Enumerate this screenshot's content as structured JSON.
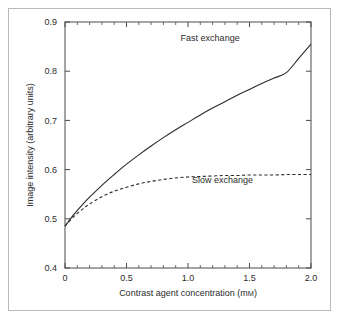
{
  "figure": {
    "background_color": "#ffffff",
    "frame_color": "#b9b9b9",
    "axis_color": "#4a4a4a",
    "curve_color": "#2a2a2a"
  },
  "chart_data": {
    "type": "line",
    "title": "",
    "xlabel": "Contrast agent concentration (mM)",
    "xlabel_text": "Contrast agent concentration (m",
    "xlabel_unit": "M",
    "xlabel_close": ")",
    "ylabel": "Image intensity (arbitrary units)",
    "xlim": [
      0,
      2.0
    ],
    "ylim": [
      0.4,
      0.9
    ],
    "grid": false,
    "legend_position": "inline-annotation",
    "x_ticks": [
      0,
      0.5,
      1.0,
      1.5,
      2.0
    ],
    "x_tick_labels": [
      "0",
      "0.5",
      "1.0",
      "1.5",
      "2.0"
    ],
    "x_minor_step": 0.1,
    "y_ticks": [
      0.4,
      0.5,
      0.6,
      0.7,
      0.8,
      0.9
    ],
    "y_tick_labels": [
      "0.4",
      "0.5",
      "0.6",
      "0.7",
      "0.8",
      "0.9"
    ],
    "series": [
      {
        "name": "Fast exchange",
        "style": "solid",
        "annotation": "Fast exchange",
        "x": [
          0,
          0.05,
          0.1,
          0.15,
          0.2,
          0.3,
          0.4,
          0.5,
          0.6,
          0.7,
          0.8,
          0.9,
          1.0,
          1.1,
          1.2,
          1.3,
          1.4,
          1.5,
          1.6,
          1.7,
          1.8,
          1.9,
          2.0
        ],
        "values": [
          0.485,
          0.502,
          0.517,
          0.531,
          0.544,
          0.568,
          0.59,
          0.611,
          0.63,
          0.648,
          0.665,
          0.681,
          0.696,
          0.711,
          0.725,
          0.738,
          0.751,
          0.763,
          0.775,
          0.786,
          0.797,
          0.826,
          0.855
        ]
      },
      {
        "name": "Slow exchange",
        "style": "dashed",
        "annotation": "Slow exchange",
        "x": [
          0,
          0.05,
          0.1,
          0.15,
          0.2,
          0.3,
          0.4,
          0.5,
          0.6,
          0.7,
          0.8,
          0.9,
          1.0,
          1.1,
          1.2,
          1.3,
          1.4,
          1.5,
          1.6,
          1.7,
          1.8,
          1.9,
          2.0
        ],
        "values": [
          0.485,
          0.499,
          0.511,
          0.521,
          0.53,
          0.545,
          0.556,
          0.564,
          0.571,
          0.576,
          0.58,
          0.583,
          0.585,
          0.586,
          0.587,
          0.588,
          0.588,
          0.589,
          0.589,
          0.589,
          0.59,
          0.59,
          0.59
        ]
      }
    ],
    "annotations": [
      {
        "text": "Fast exchange",
        "x": 1.18,
        "y": 0.862
      },
      {
        "text": "Slow exchange",
        "x": 1.28,
        "y": 0.572
      }
    ]
  }
}
